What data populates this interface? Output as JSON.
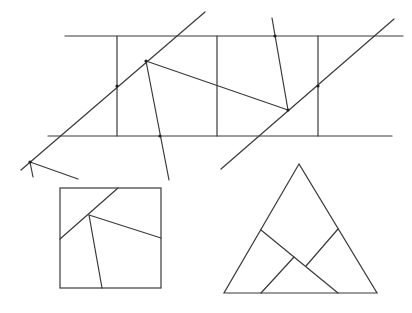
{
  "diagram": {
    "colors": {
      "stroke": "#3a3a3a",
      "background": "#ffffff",
      "dot": "#222222"
    },
    "strip": {
      "top_line": [
        [
          65,
          36
        ],
        [
          403,
          36
        ]
      ],
      "bottom_line": [
        [
          48,
          136
        ],
        [
          392,
          136
        ]
      ],
      "verticals": [
        [
          [
            117,
            36
          ],
          [
            117,
            136
          ]
        ],
        [
          [
            217,
            36
          ],
          [
            217,
            136
          ]
        ],
        [
          [
            318,
            36
          ],
          [
            318,
            136
          ]
        ]
      ],
      "diagonals": [
        [
          [
            21,
            170
          ],
          [
            205,
            12
          ]
        ],
        [
          [
            221,
            169
          ],
          [
            394,
            19
          ]
        ]
      ],
      "cuts": [
        [
          [
            146,
            61
          ],
          [
            288,
            110
          ]
        ],
        [
          [
            146,
            61
          ],
          [
            169,
            180
          ]
        ],
        [
          [
            272,
            18
          ],
          [
            288,
            110
          ]
        ],
        [
          [
            30,
            162
          ],
          [
            33,
            177
          ]
        ],
        [
          [
            30,
            162
          ],
          [
            78,
            179
          ]
        ]
      ],
      "dots": [
        [
          117,
          86
        ],
        [
          146,
          61
        ],
        [
          160,
          136
        ],
        [
          275,
          36
        ],
        [
          288,
          110
        ],
        [
          318,
          86
        ],
        [
          30,
          162
        ]
      ]
    },
    "square": {
      "rect": [
        60,
        188,
        101,
        100
      ],
      "cuts": [
        [
          [
            118,
            188
          ],
          [
            60,
            239
          ]
        ],
        [
          [
            89,
            215
          ],
          [
            161,
            238
          ]
        ],
        [
          [
            89,
            215
          ],
          [
            102,
            288
          ]
        ]
      ]
    },
    "triangle": {
      "outline": [
        [
          299,
          164
        ],
        [
          224,
          293
        ],
        [
          377,
          293
        ]
      ],
      "cuts": [
        [
          [
            261,
            230
          ],
          [
            338,
            293
          ]
        ],
        [
          [
            338,
            229
          ],
          [
            306,
            266
          ]
        ],
        [
          [
            294,
            257
          ],
          [
            261,
            293
          ]
        ]
      ]
    }
  }
}
